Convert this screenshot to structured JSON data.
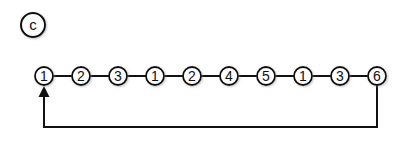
{
  "figure": {
    "panel_label": "c",
    "sequence": [
      "1",
      "2",
      "3",
      "1",
      "2",
      "4",
      "5",
      "1",
      "3",
      "6"
    ],
    "loop": {
      "from_index": 9,
      "to_index": 0,
      "description": "return arrow from last node back to first"
    }
  }
}
